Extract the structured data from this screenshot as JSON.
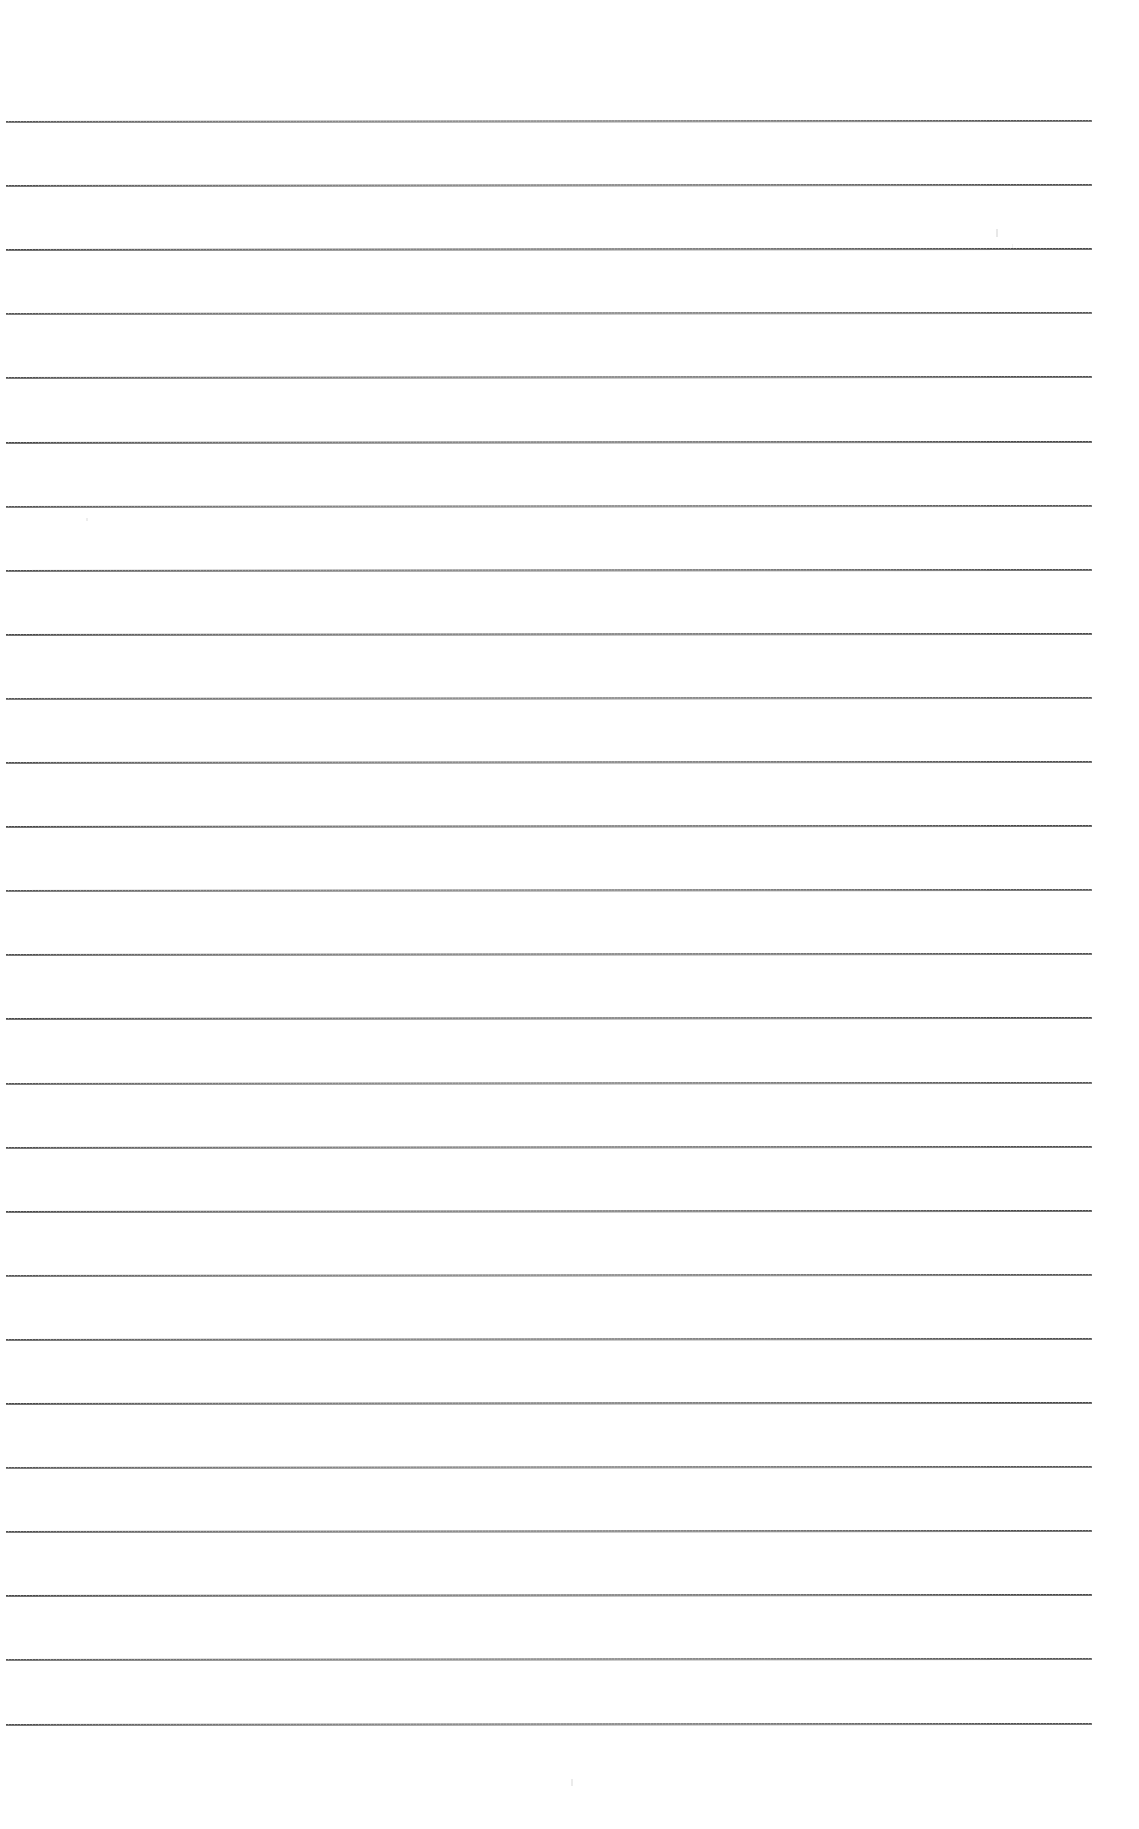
{
  "document": {
    "kind": "scanned-ruled-paper",
    "title": "Blank Ruled Notebook Page",
    "page_width": 1139,
    "page_height": 1829,
    "background_color": "#ffffff",
    "text_content": "",
    "visible_text": []
  },
  "ruling": {
    "line_color": "#434343",
    "line_shadow_color": "#6f6f6f",
    "line_thickness_px": 2,
    "line_count": 26,
    "line_start_x": 6,
    "line_end_x": 1092,
    "first_line_y": 122,
    "line_spacing_px": 64.1,
    "skew_px_across_page": -1,
    "line_y_positions": [
      122,
      186.1,
      250.2,
      314.3,
      378.4,
      442.5,
      506.6,
      570.7,
      634.8,
      698.9,
      763.0,
      827.1,
      891.2,
      955.3,
      1019.4,
      1083.5,
      1147.6,
      1211.7,
      1275.8,
      1339.9,
      1404.0,
      1468.1,
      1532.2,
      1596.3,
      1660.4,
      1724.5
    ]
  },
  "margins": {
    "top_margin_px": 122,
    "bottom_margin_px": 97,
    "left_margin_px": 6,
    "right_margin_px": 47
  },
  "artifacts": {
    "specks": [
      {
        "x": 996,
        "y": 229,
        "width": 2,
        "height": 8,
        "opacity": 0.5
      },
      {
        "x": 571,
        "y": 1779,
        "width": 2,
        "height": 7,
        "opacity": 0.45
      },
      {
        "x": 86,
        "y": 518,
        "width": 2,
        "height": 3,
        "opacity": 0.4
      },
      {
        "x": 1012,
        "y": 244,
        "width": 1,
        "height": 4,
        "opacity": 0.35
      }
    ]
  }
}
